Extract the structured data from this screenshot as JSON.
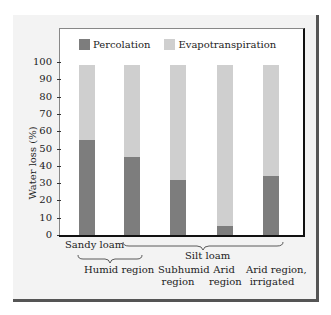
{
  "chart_data": {
    "type": "bar",
    "stacked": true,
    "title": "",
    "xlabel": "",
    "ylabel": "Water loss (%)",
    "ylim": [
      0,
      100
    ],
    "yticks": [
      0,
      10,
      20,
      30,
      40,
      50,
      60,
      70,
      80,
      90,
      100
    ],
    "grid": false,
    "legend_position": "top",
    "categories": [
      "Sandy loam, Humid region",
      "Silt loam, Humid region",
      "Silt loam, Subhumid region",
      "Silt loam, Arid region",
      "Silt loam, Arid region, irrigated"
    ],
    "series": [
      {
        "name": "Percolation",
        "color": "#7d7d7d",
        "values": [
          55,
          45,
          32,
          5,
          34
        ]
      },
      {
        "name": "Evapotranspiration",
        "color": "#cfcfcf",
        "values": [
          45,
          55,
          68,
          95,
          66
        ]
      }
    ],
    "group_labels": {
      "sandy_loam": "Sandy loam",
      "silt_loam": "Silt loam",
      "humid_region": "Humid region",
      "subhumid_region": [
        "Subhumid",
        "region"
      ],
      "arid_region": [
        "Arid",
        "region"
      ],
      "arid_irrigated": [
        "Arid region,",
        "irrigated"
      ]
    }
  },
  "legend": {
    "percolation": "Percolation",
    "evapotranspiration": "Evapotranspiration"
  },
  "yaxis_label": "Water loss (%)",
  "tick_labels": [
    "100",
    "90",
    "80",
    "70",
    "60",
    "50",
    "40",
    "30",
    "20",
    "10",
    "0"
  ],
  "labels": {
    "sandy_loam": "Sandy loam",
    "silt_loam": "Silt loam",
    "humid_region": "Humid region",
    "subhumid_1": "Subhumid",
    "subhumid_2": "region",
    "arid_1": "Arid",
    "arid_2": "region",
    "arid_irr_1": "Arid region,",
    "arid_irr_2": "irrigated"
  }
}
